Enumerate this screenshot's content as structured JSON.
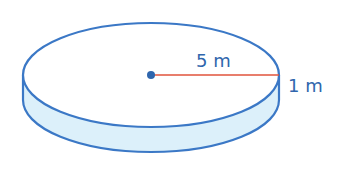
{
  "diagram": {
    "shape": "cylinder",
    "radius_label": "5 m",
    "height_label": "1 m",
    "colors": {
      "outline": "#3b78c6",
      "side_fill": "#dcf0fa",
      "top_fill": "#ffffff",
      "radius_line": "#e0533b",
      "center_dot": "#2f66ad",
      "label": "#2f66ad"
    }
  }
}
